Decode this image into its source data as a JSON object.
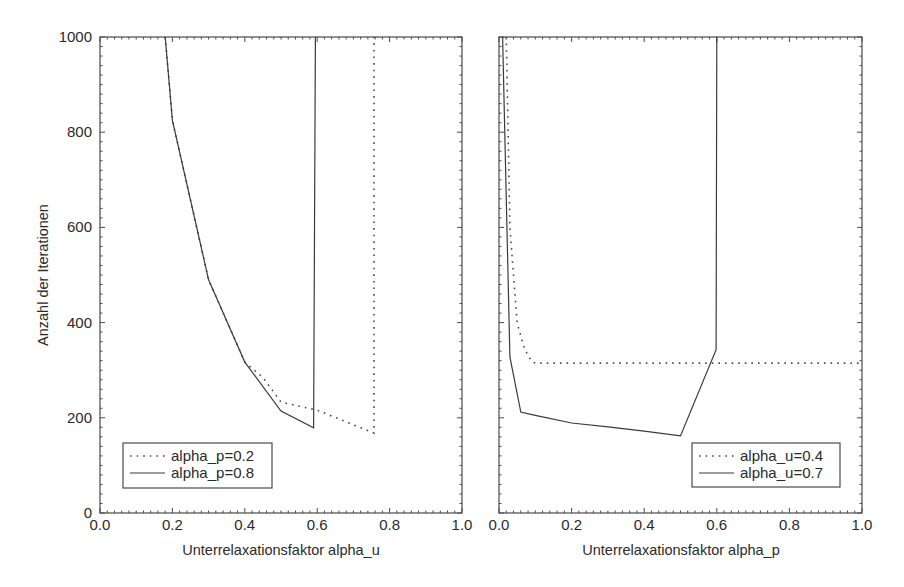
{
  "chart_data": [
    {
      "type": "line",
      "panel": "left",
      "title": "",
      "xlabel": "Unterrelaxationsfaktor alpha_u",
      "ylabel": "Anzahl der Iterationen",
      "xlim": [
        0.0,
        1.0
      ],
      "ylim": [
        0,
        1000
      ],
      "xticks": [
        "0.0",
        "0.2",
        "0.4",
        "0.6",
        "0.8",
        "1.0"
      ],
      "yticks": [
        "0",
        "200",
        "400",
        "600",
        "800",
        "1000"
      ],
      "grid": false,
      "legend_position": "lower left",
      "series": [
        {
          "name": "alpha_p=0.2",
          "style": "dotted",
          "x": [
            0.18,
            0.2,
            0.3,
            0.4,
            0.45,
            0.5,
            0.6,
            0.757,
            0.757
          ],
          "y": [
            1000,
            825,
            490,
            317,
            285,
            233,
            216,
            168,
            1000
          ]
        },
        {
          "name": "alpha_p=0.8",
          "style": "solid",
          "x": [
            0.18,
            0.2,
            0.3,
            0.4,
            0.5,
            0.59,
            0.595
          ],
          "y": [
            1000,
            825,
            490,
            317,
            214,
            179,
            1000
          ]
        }
      ]
    },
    {
      "type": "line",
      "panel": "right",
      "title": "",
      "xlabel": "Unterrelaxationsfaktor alpha_p",
      "ylabel": "",
      "xlim": [
        0.0,
        1.0
      ],
      "ylim": [
        0,
        1000
      ],
      "xticks": [
        "0.0",
        "0.2",
        "0.4",
        "0.6",
        "0.8",
        "1.0"
      ],
      "yticks": [],
      "grid": false,
      "legend_position": "lower right",
      "series": [
        {
          "name": "alpha_u=0.4",
          "style": "dotted",
          "x": [
            0.02,
            0.03,
            0.05,
            0.07,
            0.09,
            0.1,
            0.3,
            0.6,
            1.0
          ],
          "y": [
            1000,
            600,
            400,
            345,
            318,
            315,
            315,
            315,
            315
          ]
        },
        {
          "name": "alpha_u=0.7",
          "style": "solid",
          "x": [
            0.01,
            0.03,
            0.06,
            0.1,
            0.2,
            0.3,
            0.4,
            0.5,
            0.598,
            0.6
          ],
          "y": [
            1000,
            328,
            212,
            205,
            189,
            181,
            172,
            162,
            343,
            1000
          ]
        }
      ]
    }
  ],
  "layout": {
    "panels": [
      {
        "left": 100,
        "right": 462,
        "top": 37,
        "bottom": 513,
        "legend": {
          "x": 123,
          "y": 443,
          "w": 149,
          "h": 45
        }
      },
      {
        "left": 499,
        "right": 862,
        "top": 37,
        "bottom": 513,
        "legend": {
          "x": 692,
          "y": 443,
          "w": 148,
          "h": 44
        }
      }
    ],
    "colors": {
      "line": "#3a3a3a",
      "frame": "#4a4a4a",
      "text": "#2a2a2a",
      "background": "#ffffff"
    }
  }
}
